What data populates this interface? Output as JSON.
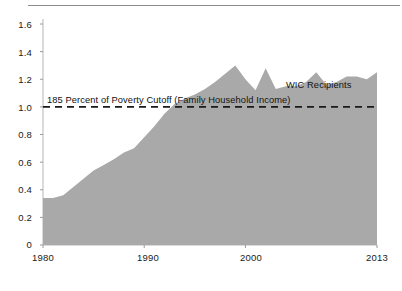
{
  "chart_data": {
    "type": "area",
    "title": "",
    "subtitle": "",
    "xlabel": "",
    "ylabel": "",
    "xlim": [
      1980,
      2013
    ],
    "ylim": [
      0,
      1.6
    ],
    "grid": false,
    "legend_position": "inline-annotation",
    "x_tick_labels": [
      "1980",
      "1990",
      "2000",
      "2013"
    ],
    "x_tick_values": [
      1980,
      1990,
      2000,
      2013
    ],
    "y_tick_labels": [
      "0",
      "0.2",
      "0.4",
      "0.6",
      "0.8",
      "1.0",
      "1.2",
      "1.4",
      "1.6"
    ],
    "y_tick_values": [
      0,
      0.2,
      0.4,
      0.6,
      0.8,
      1.0,
      1.2,
      1.4,
      1.6
    ],
    "series": [
      {
        "name": "WIC Recipients",
        "type": "area",
        "fill_color": "#a9a9a9",
        "x": [
          1980,
          1981,
          1982,
          1983,
          1984,
          1985,
          1986,
          1987,
          1988,
          1989,
          1990,
          1991,
          1992,
          1993,
          1994,
          1995,
          1996,
          1997,
          1998,
          1999,
          2000,
          2001,
          2002,
          2003,
          2004,
          2005,
          2006,
          2007,
          2008,
          2009,
          2010,
          2011,
          2012,
          2013
        ],
        "values": [
          0.34,
          0.34,
          0.36,
          0.42,
          0.48,
          0.54,
          0.58,
          0.62,
          0.67,
          0.7,
          0.78,
          0.86,
          0.95,
          1.02,
          1.06,
          1.09,
          1.13,
          1.18,
          1.24,
          1.3,
          1.2,
          1.12,
          1.28,
          1.13,
          1.15,
          1.15,
          1.18,
          1.25,
          1.16,
          1.18,
          1.22,
          1.22,
          1.2,
          1.25
        ]
      }
    ],
    "reference_line": {
      "label": "185 Percent of Poverty Cutoff (Family Household Income)",
      "value": 1.0,
      "style": "dashed",
      "color": "#1a1a1a"
    },
    "series_annotation": {
      "label": "WIC Recipients",
      "x": 2004,
      "y": 1.1
    }
  },
  "figure": {
    "top_rule": true,
    "background": "#ffffff"
  }
}
